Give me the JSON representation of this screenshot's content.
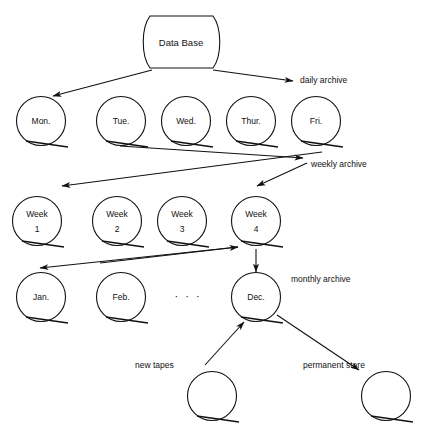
{
  "diagram": {
    "database": {
      "label": "Data Base",
      "shape": "cylinder-deck"
    },
    "daily_row": {
      "archive_label": "daily archive",
      "tapes": [
        {
          "label": "Mon."
        },
        {
          "label": "Tue."
        },
        {
          "label": "Wed."
        },
        {
          "label": "Thur."
        },
        {
          "label": "Fri."
        }
      ]
    },
    "weekly_row": {
      "archive_label": "weekly archive",
      "tapes": [
        {
          "line1": "Week",
          "line2": "1"
        },
        {
          "line1": "Week",
          "line2": "2"
        },
        {
          "line1": "Week",
          "line2": "3"
        },
        {
          "line1": "Week",
          "line2": "4"
        }
      ]
    },
    "monthly_row": {
      "archive_label": "monthly archive",
      "ellipsis": "· · ·",
      "tapes": [
        {
          "label": "Jan."
        },
        {
          "label": "Feb."
        },
        {
          "label": "Dec."
        }
      ]
    },
    "bottom_row": {
      "new_tapes_label": "new tapes",
      "permanent_store_label": "permanent store",
      "tapes": [
        {
          "label": ""
        },
        {
          "label": ""
        }
      ]
    },
    "colors": {
      "ink": "#111111",
      "background": "#ffffff"
    }
  }
}
